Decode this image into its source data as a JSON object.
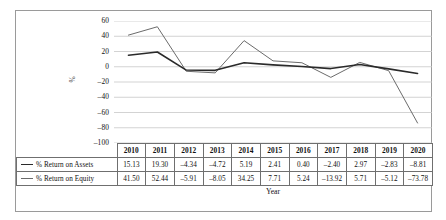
{
  "chart_data": {
    "type": "line",
    "title": "",
    "xlabel": "Year",
    "ylabel": "%",
    "categories": [
      "2010",
      "2011",
      "2012",
      "2013",
      "2014",
      "2015",
      "2016",
      "2017",
      "2018",
      "2019",
      "2020"
    ],
    "ylim": [
      -100,
      60
    ],
    "yticks": [
      60,
      40,
      20,
      0,
      -20,
      -40,
      -60,
      -80,
      -100
    ],
    "ytick_labels": [
      "60",
      "40",
      "20",
      "0",
      "–20",
      "–40",
      "–60",
      "–80",
      "–100"
    ],
    "grid": true,
    "legend_position": "table-left",
    "series": [
      {
        "name": "% Return on Assets",
        "color": "#2a2a2a",
        "line_width": 1.6,
        "values": [
          15.13,
          19.3,
          -4.34,
          -4.72,
          5.19,
          2.41,
          0.4,
          -2.4,
          2.97,
          -2.83,
          -8.81
        ],
        "labels": [
          "15.13",
          "19.30",
          "–4.34",
          "–4.72",
          "5.19",
          "2.41",
          "0.40",
          "–2.40",
          "2.97",
          "–2.83",
          "–8.81"
        ]
      },
      {
        "name": "% Return on Equity",
        "color": "#6b6b6b",
        "line_width": 1.0,
        "values": [
          41.5,
          52.44,
          -5.91,
          -8.05,
          34.25,
          7.71,
          5.24,
          -13.92,
          5.71,
          -5.12,
          -73.78
        ],
        "labels": [
          "41.50",
          "52.44",
          "–5.91",
          "–8.05",
          "34.25",
          "7.71",
          "5.24",
          "–13.92",
          "5.71",
          "–5.12",
          "–73.78"
        ]
      }
    ]
  },
  "table": {
    "header_label_cell": "",
    "year_headers": [
      "2010",
      "2011",
      "2012",
      "2013",
      "2014",
      "2015",
      "2016",
      "2017",
      "2018",
      "2019",
      "2020"
    ],
    "rows": [
      {
        "label": "% Return on Assets",
        "swatch": "line-swatch-dark-icon",
        "values": [
          "15.13",
          "19.30",
          "–4.34",
          "–4.72",
          "5.19",
          "2.41",
          "0.40",
          "–2.40",
          "2.97",
          "–2.83",
          "–8.81"
        ]
      },
      {
        "label": "% Return on Equity",
        "swatch": "line-swatch-gray-icon",
        "values": [
          "41.50",
          "52.44",
          "–5.91",
          "–8.05",
          "34.25",
          "7.71",
          "5.24",
          "–13.92",
          "5.71",
          "–5.12",
          "–73.78"
        ]
      }
    ]
  },
  "axes": {
    "y_title": "%",
    "x_title": "Year"
  },
  "colors": {
    "assets_line": "#2a2a2a",
    "equity_line": "#6b6b6b",
    "gridline": "#c8c8c8",
    "frame": "#9a9a9a",
    "table_border": "#6f6f6f"
  }
}
